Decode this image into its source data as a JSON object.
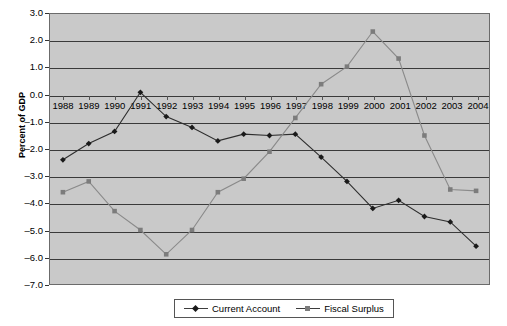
{
  "chart_data": {
    "type": "line",
    "title": "",
    "xlabel": "",
    "ylabel": "Percent of GDP",
    "categories": [
      "1988",
      "1989",
      "1990",
      "1991",
      "1992",
      "1993",
      "1994",
      "1995",
      "1996",
      "1997",
      "1998",
      "1999",
      "2000",
      "2001",
      "2002",
      "2003",
      "2004"
    ],
    "ylim": [
      -7.0,
      3.0
    ],
    "ytick_labels": [
      "3.0",
      "2.0",
      "1.0",
      "0.0",
      "-1.0",
      "-2.0",
      "-3.0",
      "-4.0",
      "-5.0",
      "-6.0",
      "-7.0"
    ],
    "ytick_values": [
      3.0,
      2.0,
      1.0,
      0.0,
      -1.0,
      -2.0,
      -3.0,
      -4.0,
      -5.0,
      -6.0,
      -7.0
    ],
    "grid": true,
    "legend_position": "bottom",
    "series": [
      {
        "name": "Current Account",
        "marker": "diamond",
        "color": "#1a1a1a",
        "values": [
          -2.4,
          -1.8,
          -1.35,
          0.1,
          -0.8,
          -1.2,
          -1.7,
          -1.45,
          -1.5,
          -1.45,
          -2.3,
          -3.2,
          -4.2,
          -3.9,
          -4.5,
          -4.7,
          -5.6
        ]
      },
      {
        "name": "Fiscal Surplus",
        "marker": "square",
        "color": "#7c7c7c",
        "values": [
          -3.6,
          -3.2,
          -4.3,
          -5.0,
          -5.9,
          -5.0,
          -3.6,
          -3.1,
          -2.1,
          -0.85,
          0.4,
          1.05,
          2.35,
          1.35,
          -1.5,
          -3.5,
          -3.55
        ]
      }
    ]
  },
  "legend": {
    "items": [
      {
        "label": "Current Account"
      },
      {
        "label": "Fiscal Surplus"
      }
    ]
  },
  "axis": {
    "y_title": "Percent of GDP"
  }
}
